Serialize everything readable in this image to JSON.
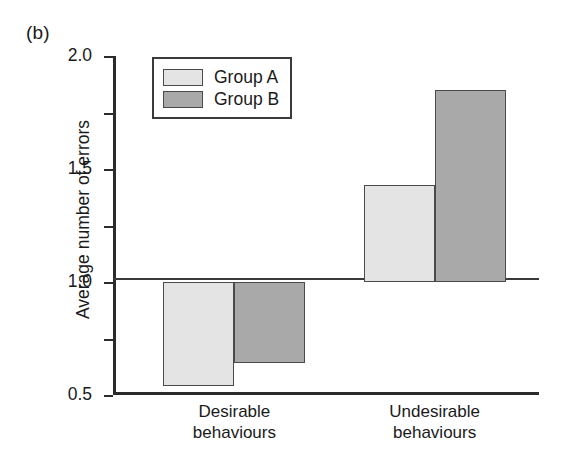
{
  "figure": {
    "panel_label": "(b)"
  },
  "chart_data": {
    "type": "bar",
    "title": "",
    "subtitle": "",
    "xlabel": "",
    "ylabel": "Average number of errors",
    "categories": [
      "Desirable\nbehaviours",
      "Undesirable\nbehaviours"
    ],
    "category_lines": [
      [
        "Desirable",
        "behaviours"
      ],
      [
        "Undesirable",
        "behaviours"
      ]
    ],
    "series": [
      {
        "name": "Group A",
        "values": [
          -0.92,
          0.86
        ],
        "color": "#e4e4e4"
      },
      {
        "name": "Group B",
        "values": [
          -0.72,
          1.7
        ],
        "color": "#a9a9a9"
      }
    ],
    "ylim": [
      -1.0,
      2.0
    ],
    "ytick_values": [
      2.0,
      1.5,
      1.0,
      0.5,
      0,
      -0.5,
      -1.0
    ],
    "ytick_labels": [
      "2.0",
      "1.5",
      "1.0",
      "0.5",
      "0",
      "–0.5",
      "–0.1"
    ],
    "grid": false,
    "zero_line": true,
    "legend_position": "top-left-inside",
    "legend_entries": [
      "Group A",
      "Group B"
    ],
    "bar_outline_color": "#4a4a4a",
    "axis_color": "#2b2b2b"
  }
}
